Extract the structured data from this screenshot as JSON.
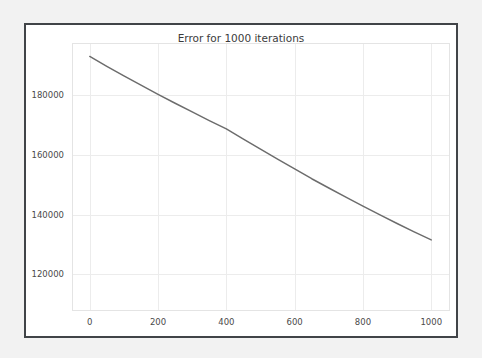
{
  "figure": {
    "background_color": "#ffffff",
    "page_background_color": "#f2f2f2",
    "frame_color": "#414448"
  },
  "chart_data": {
    "type": "line",
    "title": "Error for 1000 iterations",
    "xlabel": "",
    "ylabel": "",
    "grid": true,
    "legend": "none",
    "line_color": "#6c6c6c",
    "xlim": [
      -52,
      1052
    ],
    "ylim": [
      108000,
      197500
    ],
    "xticks": [
      0,
      200,
      400,
      600,
      800,
      1000
    ],
    "xtick_labels": [
      "0",
      "200",
      "400",
      "600",
      "800",
      "1000"
    ],
    "yticks": [
      120000,
      140000,
      160000,
      180000
    ],
    "ytick_labels": [
      "120000",
      "140000",
      "160000",
      "180000"
    ],
    "series": [
      {
        "name": "error",
        "x": [
          0,
          50,
          100,
          150,
          200,
          250,
          300,
          350,
          400,
          450,
          500,
          550,
          600,
          650,
          700,
          750,
          800,
          850,
          900,
          950,
          1000
        ],
        "values": [
          193000,
          189700,
          186500,
          183400,
          180300,
          177300,
          174400,
          171500,
          168700,
          165300,
          161900,
          158600,
          155300,
          152000,
          148900,
          145800,
          142800,
          139900,
          137000,
          134200,
          131500
        ]
      }
    ],
    "annotations": []
  }
}
